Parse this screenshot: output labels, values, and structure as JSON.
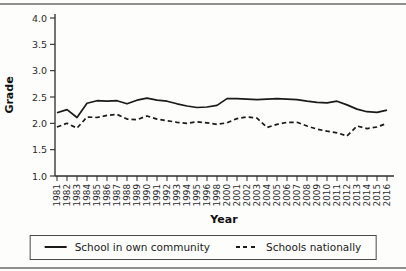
{
  "colors": {
    "line": "#1a1a1a",
    "axis": "#2b2b2b",
    "rule_gray": "#8f8f8f"
  },
  "chart_data": {
    "type": "line",
    "title": "",
    "xlabel": "Year",
    "ylabel": "Grade",
    "ylim": [
      1.0,
      4.0
    ],
    "yticks": [
      4.0,
      3.5,
      3.0,
      2.5,
      2.0,
      1.5,
      1.0
    ],
    "grid": false,
    "legend_position": "bottom",
    "categories": [
      "1981",
      "1982",
      "1983",
      "1984",
      "1985",
      "1986",
      "1987",
      "1988",
      "1989",
      "1990",
      "1991",
      "1992",
      "1993",
      "1994",
      "1995",
      "1996",
      "1998",
      "2000",
      "2001",
      "2002",
      "2003",
      "2004",
      "2005",
      "2006",
      "2007",
      "2008",
      "2009",
      "2010",
      "2011",
      "2012",
      "2013",
      "2014",
      "2015",
      "2016"
    ],
    "series": [
      {
        "name": "School in own community",
        "style": "solid",
        "values": [
          2.2,
          2.26,
          2.11,
          2.38,
          2.43,
          2.42,
          2.43,
          2.37,
          2.44,
          2.48,
          2.44,
          2.42,
          2.37,
          2.33,
          2.3,
          2.31,
          2.34,
          2.47,
          2.47,
          2.46,
          2.45,
          2.46,
          2.47,
          2.46,
          2.45,
          2.42,
          2.4,
          2.39,
          2.42,
          2.35,
          2.27,
          2.22,
          2.21,
          2.25
        ]
      },
      {
        "name": "Schools nationally",
        "style": "dashed",
        "values": [
          1.93,
          2.0,
          1.91,
          2.12,
          2.11,
          2.15,
          2.17,
          2.08,
          2.07,
          2.14,
          2.08,
          2.05,
          2.02,
          2.0,
          2.03,
          2.01,
          1.98,
          2.01,
          2.09,
          2.12,
          2.1,
          1.92,
          1.98,
          2.02,
          2.02,
          1.95,
          1.89,
          1.85,
          1.82,
          1.76,
          1.95,
          1.9,
          1.93,
          2.0
        ]
      }
    ]
  }
}
